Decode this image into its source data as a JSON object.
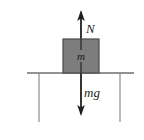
{
  "diagram": {
    "type": "physics-free-body-diagram",
    "background_color": "#ffffff",
    "block": {
      "label": "m",
      "fill_color": "#7d7d7d",
      "stroke_color": "#4a4a4a",
      "x": 63,
      "y": 39,
      "width": 36,
      "height": 34
    },
    "ground": {
      "name": "ground-surface-line",
      "color": "#6e6e6e",
      "x1": 27,
      "x2": 134,
      "y": 73
    },
    "supports": [
      {
        "name": "support-line-left",
        "x": 39,
        "y1": 73,
        "y2": 122,
        "color": "#8a8a8a"
      },
      {
        "name": "support-line-right",
        "x": 120,
        "y1": 73,
        "y2": 122,
        "color": "#8a8a8a"
      }
    ],
    "forces": [
      {
        "name": "normal-force",
        "label": "N",
        "direction": "up",
        "color": "#231f20",
        "tail_x": 81,
        "tail_y": 56,
        "tip_y": 10,
        "label_x": 86,
        "label_y": 33
      },
      {
        "name": "weight-force",
        "label": "mg",
        "direction": "down",
        "color": "#231f20",
        "tail_x": 81,
        "tail_y": 56,
        "tip_y": 116,
        "label_x": 84,
        "label_y": 97
      }
    ]
  }
}
